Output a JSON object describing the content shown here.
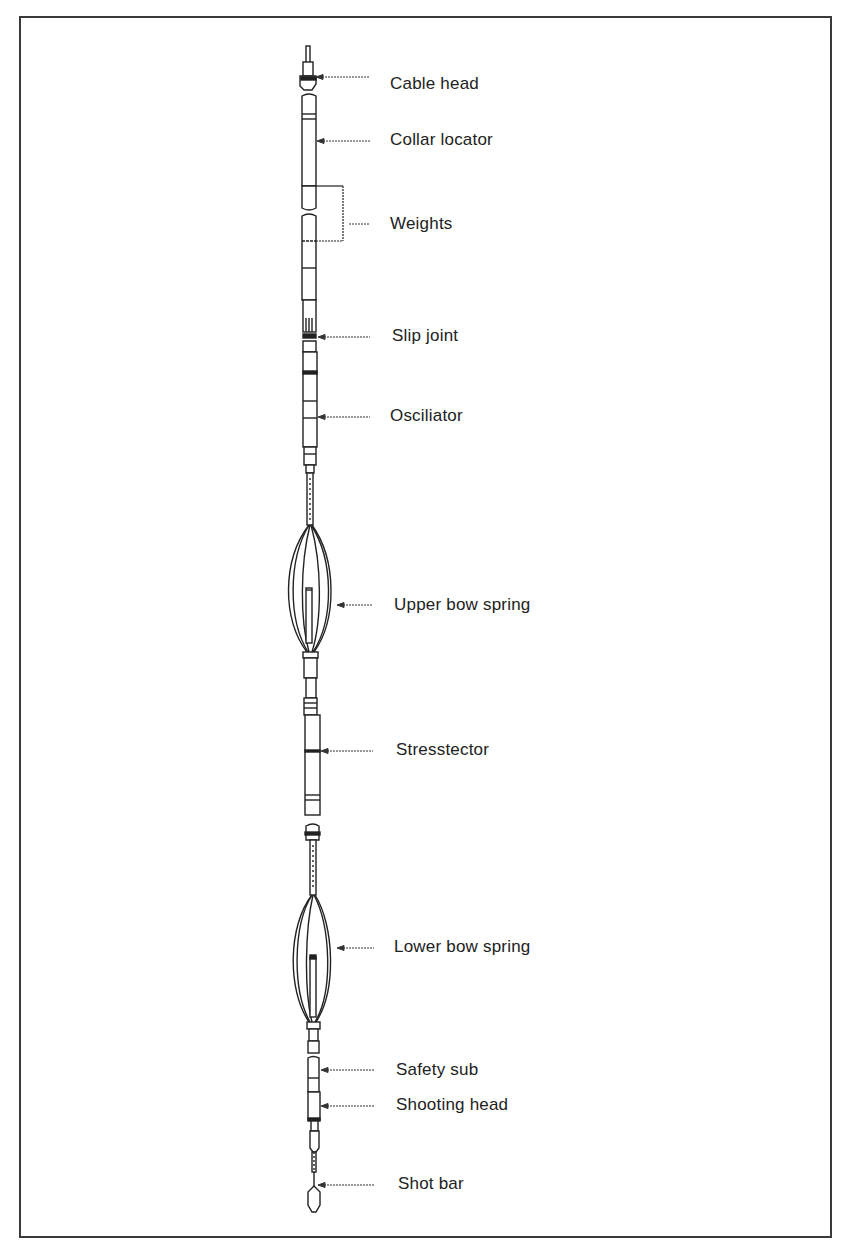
{
  "figure": {
    "type": "labeled component diagram",
    "border_color": "#3a3a3a",
    "ink_color": "#222222"
  },
  "labels": [
    {
      "id": "cable-head",
      "text": "Cable head",
      "x": 390,
      "y": 74,
      "pointer_y": 77,
      "pointer_from": 316,
      "pointer_to": 370
    },
    {
      "id": "collar-locator",
      "text": "Collar locator",
      "x": 390,
      "y": 130,
      "pointer_y": 141,
      "pointer_from": 317,
      "pointer_to": 370
    },
    {
      "id": "weights",
      "text": "Weights",
      "x": 390,
      "y": 214,
      "pointer_y": 224,
      "pointer_from": 343,
      "pointer_to": 370
    },
    {
      "id": "slip-joint",
      "text": "Slip joint",
      "x": 392,
      "y": 326,
      "pointer_y": 337,
      "pointer_from": 318,
      "pointer_to": 370
    },
    {
      "id": "osciliator",
      "text": "Osciliator",
      "x": 390,
      "y": 406,
      "pointer_y": 417,
      "pointer_from": 318,
      "pointer_to": 370
    },
    {
      "id": "upper-bow-spring",
      "text": "Upper bow spring",
      "x": 394,
      "y": 595,
      "pointer_y": 605,
      "pointer_from": 337,
      "pointer_to": 372
    },
    {
      "id": "stresstector",
      "text": "Stresstector",
      "x": 396,
      "y": 740,
      "pointer_y": 751,
      "pointer_from": 321,
      "pointer_to": 373
    },
    {
      "id": "lower-bow-spring",
      "text": "Lower bow spring",
      "x": 394,
      "y": 937,
      "pointer_y": 948,
      "pointer_from": 337,
      "pointer_to": 374
    },
    {
      "id": "safety-sub",
      "text": "Safety sub",
      "x": 396,
      "y": 1060,
      "pointer_y": 1070,
      "pointer_from": 321,
      "pointer_to": 374
    },
    {
      "id": "shooting-head",
      "text": "Shooting head",
      "x": 396,
      "y": 1095,
      "pointer_y": 1106,
      "pointer_from": 321,
      "pointer_to": 374
    },
    {
      "id": "shot-bar",
      "text": "Shot bar",
      "x": 398,
      "y": 1174,
      "pointer_y": 1185,
      "pointer_from": 318,
      "pointer_to": 374
    }
  ]
}
